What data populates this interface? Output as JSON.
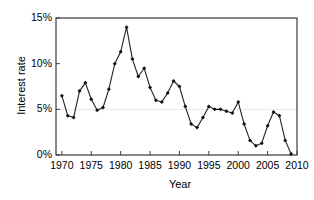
{
  "chart_data": {
    "type": "line",
    "title": "",
    "xlabel": "Year",
    "ylabel": "Interest rate",
    "xlim": [
      1969,
      2010
    ],
    "ylim": [
      0,
      15
    ],
    "yticks": [
      0,
      5,
      10,
      15
    ],
    "ytick_labels": [
      "0%",
      "5%",
      "10%",
      "15%"
    ],
    "xticks": [
      1970,
      1975,
      1980,
      1985,
      1990,
      1995,
      2000,
      2005,
      2010
    ],
    "xtick_labels": [
      "1970",
      "1975",
      "1980",
      "1985",
      "1990",
      "1995",
      "2000",
      "2005",
      "2010"
    ],
    "grid": "horizontal gridline at 5% only",
    "legend": "none",
    "marker": "filled diamond",
    "line_color": "#222222",
    "marker_color": "#111111",
    "x": [
      1970,
      1971,
      1972,
      1973,
      1974,
      1975,
      1976,
      1977,
      1978,
      1979,
      1980,
      1981,
      1982,
      1983,
      1984,
      1985,
      1986,
      1987,
      1988,
      1989,
      1990,
      1991,
      1992,
      1993,
      1994,
      1995,
      1996,
      1997,
      1998,
      1999,
      2000,
      2001,
      2002,
      2003,
      2004,
      2005,
      2006,
      2007,
      2008,
      2009
    ],
    "values": [
      6.5,
      4.3,
      4.1,
      7.0,
      7.9,
      6.1,
      4.9,
      5.2,
      7.2,
      10.0,
      11.3,
      14.0,
      10.5,
      8.6,
      9.5,
      7.4,
      6.0,
      5.8,
      6.8,
      8.1,
      7.5,
      5.3,
      3.4,
      3.0,
      4.1,
      5.3,
      5.0,
      5.0,
      4.8,
      4.6,
      5.8,
      3.4,
      1.6,
      1.0,
      1.3,
      3.2,
      4.7,
      4.3,
      1.6,
      0.1
    ],
    "series_name": "Interest rate"
  }
}
